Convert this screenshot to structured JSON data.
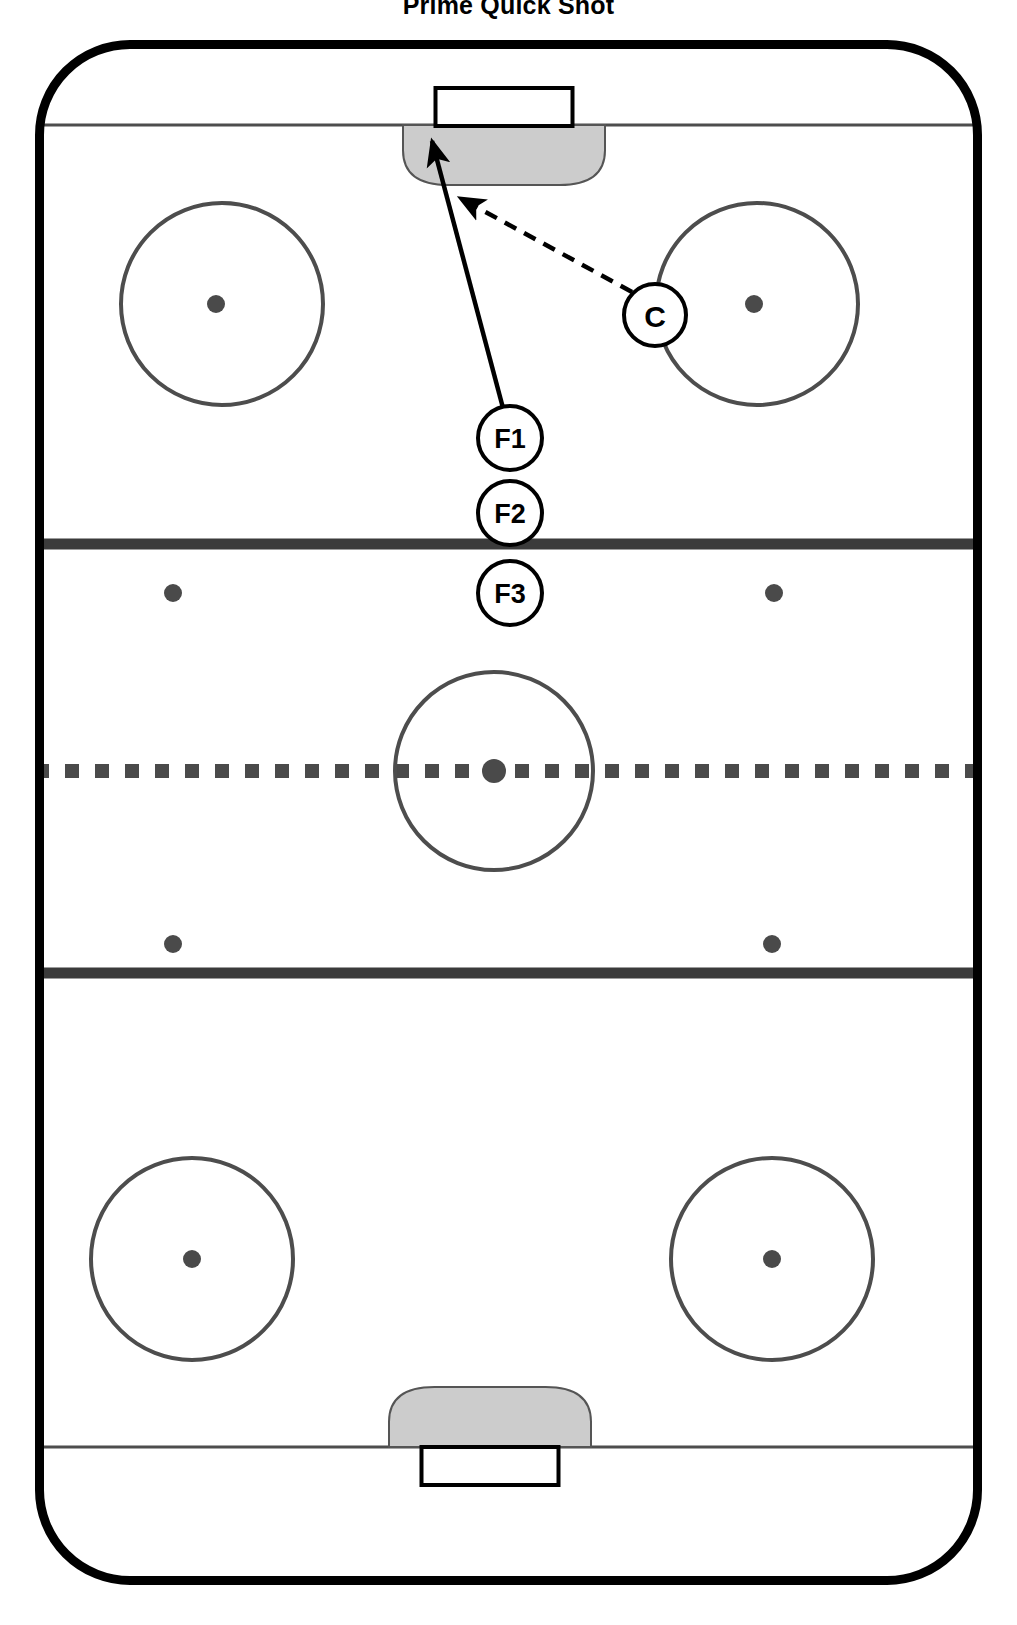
{
  "title": "Prime Quick Shot",
  "colors": {
    "board_line": "#000000",
    "ice": "#ffffff",
    "thin_line": "#4d4d4d",
    "blue_line": "#3b3b3b",
    "center_line": "#4a4a4a",
    "circle_line": "#4d4d4d",
    "dot_fill": "#4a4a4a",
    "crease_fill": "#cccccc",
    "crease_stroke": "#555555",
    "goal_fill": "#ffffff",
    "goal_stroke": "#000000",
    "marker_fill": "#ffffff",
    "marker_stroke": "#000000",
    "arrow": "#000000"
  },
  "rink": {
    "name": "ice-hockey-rink",
    "x": 35,
    "y": 40,
    "width": 947,
    "height": 1545,
    "corner_radius": 95,
    "border_width": 9
  },
  "lines": {
    "top_goal_line_y": 125,
    "bottom_goal_line_y": 1447,
    "top_blue_line_y": 544,
    "bottom_blue_line_y": 973,
    "center_line_y": 771,
    "blue_line_thickness": 11,
    "goal_line_thickness": 3,
    "center_dash_size": 14,
    "center_dash_gap": 16
  },
  "goals": [
    {
      "name": "goal-top",
      "cx": 504,
      "y": 88,
      "width": 137,
      "height": 38
    },
    {
      "name": "goal-bottom",
      "cx": 490,
      "y": 1447,
      "width": 137,
      "height": 38
    }
  ],
  "creases": [
    {
      "name": "crease-top",
      "cx": 504,
      "y": 125,
      "rx": 101,
      "ry": 60,
      "direction": "down"
    },
    {
      "name": "crease-bottom",
      "cx": 490,
      "y": 1447,
      "rx": 101,
      "ry": 60,
      "direction": "up"
    }
  ],
  "faceoff_circles": [
    {
      "name": "faceoff-circle-top-left",
      "cx": 222,
      "cy": 304,
      "r": 101
    },
    {
      "name": "faceoff-circle-top-right",
      "cx": 757,
      "cy": 304,
      "r": 101
    },
    {
      "name": "faceoff-circle-center",
      "cx": 494,
      "cy": 771,
      "r": 99
    },
    {
      "name": "faceoff-circle-bottom-left",
      "cx": 192,
      "cy": 1259,
      "r": 101
    },
    {
      "name": "faceoff-circle-bottom-right",
      "cx": 772,
      "cy": 1259,
      "r": 101
    }
  ],
  "faceoff_dots": [
    {
      "name": "faceoff-dot-top-left",
      "cx": 216,
      "cy": 304,
      "r": 9
    },
    {
      "name": "faceoff-dot-top-right",
      "cx": 754,
      "cy": 304,
      "r": 9
    },
    {
      "name": "faceoff-dot-neutral-top-left",
      "cx": 173,
      "cy": 593,
      "r": 9
    },
    {
      "name": "faceoff-dot-neutral-top-right",
      "cx": 774,
      "cy": 593,
      "r": 9
    },
    {
      "name": "faceoff-dot-center",
      "cx": 494,
      "cy": 771,
      "r": 12
    },
    {
      "name": "faceoff-dot-neutral-bottom-left",
      "cx": 173,
      "cy": 944,
      "r": 9
    },
    {
      "name": "faceoff-dot-neutral-bottom-right",
      "cx": 772,
      "cy": 944,
      "r": 9
    },
    {
      "name": "faceoff-dot-bottom-left",
      "cx": 192,
      "cy": 1259,
      "r": 9
    },
    {
      "name": "faceoff-dot-bottom-right",
      "cx": 772,
      "cy": 1259,
      "r": 9
    }
  ],
  "players": [
    {
      "name": "player-marker-c",
      "label": "C",
      "cx": 655,
      "cy": 315,
      "r": 31
    },
    {
      "name": "player-marker-f1",
      "label": "F1",
      "cx": 510,
      "cy": 438,
      "r": 32
    },
    {
      "name": "player-marker-f2",
      "label": "F2",
      "cx": 510,
      "cy": 513,
      "r": 32
    },
    {
      "name": "player-marker-f3",
      "label": "F3",
      "cx": 510,
      "cy": 593,
      "r": 32
    }
  ],
  "movements": [
    {
      "name": "shot-arrow-f1-to-net",
      "style": "solid",
      "description": "F1 skates and shoots to the net",
      "x1": 503,
      "y1": 408,
      "x2": 432,
      "y2": 141
    },
    {
      "name": "pass-arrow-c-to-net",
      "style": "dashed",
      "description": "C passes toward the net front",
      "x1": 632,
      "y1": 292,
      "x2": 460,
      "y2": 198
    }
  ]
}
